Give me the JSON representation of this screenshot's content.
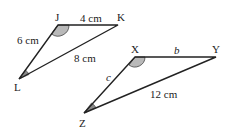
{
  "triangles": [
    {
      "name": "JKL",
      "vertices": {
        "J": "J",
        "K": "K",
        "L": "L"
      },
      "sides": {
        "JK": "4 cm",
        "JL": "6 cm",
        "KL": "8 cm"
      },
      "marked_angles": [
        "J",
        "L"
      ]
    },
    {
      "name": "XYZ",
      "vertices": {
        "X": "X",
        "Y": "Y",
        "Z": "Z"
      },
      "sides": {
        "XY": "b",
        "XZ": "c",
        "YZ": "12 cm"
      },
      "marked_angles": [
        "X",
        "Z"
      ]
    }
  ]
}
